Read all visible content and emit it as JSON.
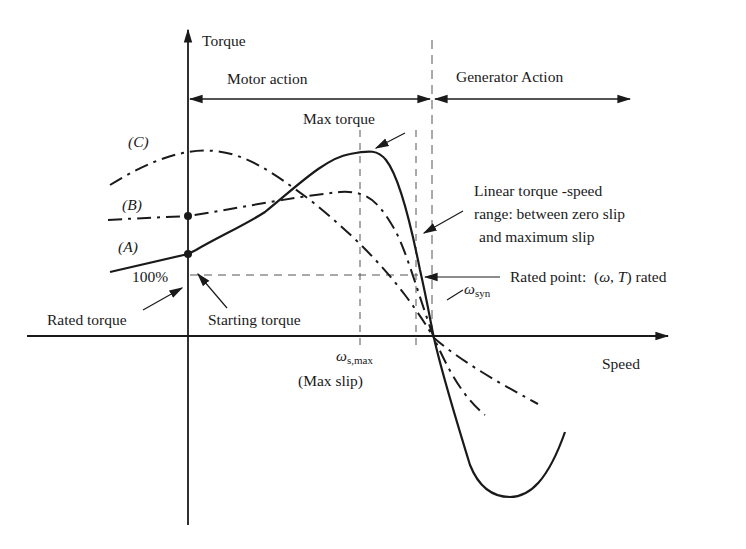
{
  "diagram": {
    "type": "torque-speed characteristic",
    "axes": {
      "y_label": "Torque",
      "x_label": "Speed"
    },
    "regions": {
      "motor": "Motor action",
      "generator": "Generator Action"
    },
    "curves": [
      {
        "id": "A",
        "label": "(A)",
        "style": "solid"
      },
      {
        "id": "B",
        "label": "(B)",
        "style": "dash-dot"
      },
      {
        "id": "C",
        "label": "(C)",
        "style": "dash-dot"
      }
    ],
    "annotations": {
      "max_torque": "Max torque",
      "linear_range_line1": "Linear torque -speed",
      "linear_range_line2": "range: between zero slip",
      "linear_range_line3": "and maximum slip",
      "rated_point_prefix": "Rated point:",
      "rated_point_expr_open": "(",
      "rated_point_omega": "ω",
      "rated_point_comma": ", ",
      "rated_point_T": "T",
      "rated_point_suffix": ") rated",
      "hundred_pct": "100%",
      "rated_torque": "Rated torque",
      "starting_torque": "Starting torque",
      "omega_syn_symbol": "ω",
      "omega_syn_sub": "syn",
      "omega_smax_symbol": "ω",
      "omega_smax_sub": "s,max",
      "max_slip": "(Max slip)"
    },
    "colors": {
      "ink": "#1a1a1a",
      "guide": "#555555",
      "background": "#ffffff"
    }
  }
}
